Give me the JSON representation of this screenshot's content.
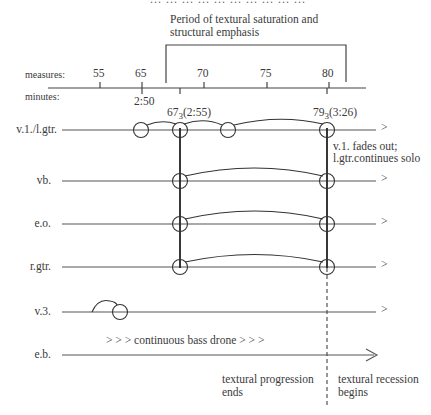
{
  "header": {
    "cropped_top_text": "... ... ... ... ... ... ... ... ... ..."
  },
  "bracket": {
    "label_line1": "Period of textural saturation and",
    "label_line2": "structural emphasis"
  },
  "axis": {
    "measures_label": "measures:",
    "minutes_label": "minutes:",
    "measure_ticks": [
      "55",
      "65",
      "70",
      "75",
      "80"
    ],
    "minute_marks": [
      {
        "label": "2:50"
      },
      {
        "label_main": "67",
        "label_sub": "3",
        "label_time": "(2:55)"
      },
      {
        "label_main": "79",
        "label_sub": "3",
        "label_time": "(3:26)"
      }
    ]
  },
  "rows": [
    {
      "label": "v.1./l.gtr.",
      "end": ">"
    },
    {
      "label": "vb.",
      "end": ">"
    },
    {
      "label": "e.o.",
      "end": ">"
    },
    {
      "label": "r.gtr.",
      "end": ">"
    },
    {
      "label": "v.3.",
      "end": ">"
    },
    {
      "label": "e.b.",
      "end": "arrow"
    }
  ],
  "annotations": {
    "v1_fade_line1": "v.1. fades out;",
    "v1_fade_line2": "l.gtr.continues solo",
    "drone": "> > > continuous bass drone > > >",
    "progression_line1": "textural progression",
    "progression_line2": "ends",
    "recession_line1": "textural recession",
    "recession_line2": "begins"
  },
  "colors": {
    "line": "#444444",
    "text": "#3a3a3a",
    "background": "#ffffff"
  }
}
